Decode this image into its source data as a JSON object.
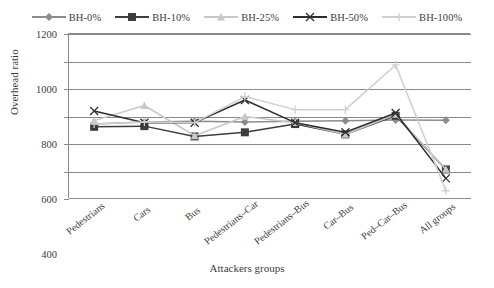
{
  "chart_data": {
    "type": "line",
    "title": "",
    "xlabel": "Attackers groups",
    "ylabel": "Overhead ratio",
    "ylim": [
      0,
      1200
    ],
    "ytick_step": 200,
    "yticks": [
      "1200",
      "1000",
      "800",
      "600",
      "400",
      "200",
      "0"
    ],
    "grid": true,
    "legend_position": "top",
    "categories": [
      "Pedestrians",
      "Cars",
      "Bus",
      "Pedestrians–Car",
      "Pedestrians–Bus",
      "Car–Bus",
      "Ped–Car–Bus",
      "All groups"
    ],
    "series": [
      {
        "name": "BH-0%",
        "color": "#8c8c8c",
        "marker": "diamond",
        "values": [
          545,
          560,
          565,
          560,
          565,
          570,
          575,
          572
        ]
      },
      {
        "name": "BH-10%",
        "color": "#3d3d3d",
        "marker": "square",
        "values": [
          525,
          530,
          455,
          485,
          545,
          470,
          605,
          215
        ]
      },
      {
        "name": "BH-25%",
        "color": "#c8c8c8",
        "marker": "triangle",
        "values": [
          570,
          680,
          460,
          600,
          555,
          470,
          615,
          215
        ]
      },
      {
        "name": "BH-50%",
        "color": "#2e2e2e",
        "marker": "cross",
        "values": [
          640,
          555,
          555,
          720,
          555,
          485,
          625,
          150
        ]
      },
      {
        "name": "BH-100%",
        "color": "#cfcfcf",
        "marker": "plus",
        "values": [
          545,
          560,
          555,
          745,
          650,
          650,
          975,
          60
        ]
      }
    ]
  },
  "legend": {
    "items": [
      {
        "label": "BH-0%",
        "marker": "diamond-marker",
        "color": "#8c8c8c"
      },
      {
        "label": "BH-10%",
        "marker": "square-marker",
        "color": "#3d3d3d"
      },
      {
        "label": "BH-25%",
        "marker": "triangle-marker",
        "color": "#c8c8c8"
      },
      {
        "label": "BH-50%",
        "marker": "cross-marker",
        "color": "#2e2e2e"
      },
      {
        "label": "BH-100%",
        "marker": "plus-marker",
        "color": "#cfcfcf"
      }
    ]
  },
  "axes": {
    "y_title": "Overhead ratio",
    "x_title": "Attackers groups"
  }
}
